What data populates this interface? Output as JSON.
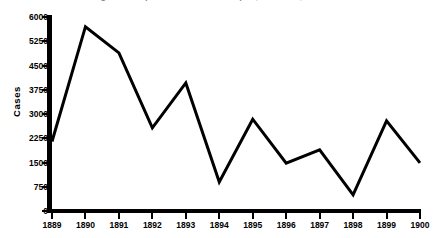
{
  "chart_data": {
    "type": "line",
    "title": "Figure 1. Reported cases of smallpox, Sheffield, 1889-1900",
    "xlabel": "",
    "ylabel": "Cases",
    "categories": [
      "1889",
      "1890",
      "1891",
      "1892",
      "1893",
      "1894",
      "1895",
      "1896",
      "1897",
      "1898",
      "1899",
      "1900"
    ],
    "values": [
      2150,
      5700,
      4890,
      2570,
      3960,
      900,
      2840,
      1480,
      1890,
      500,
      2790,
      1490
    ],
    "series": [
      {
        "name": "Cases",
        "values": [
          2150,
          5700,
          4890,
          2570,
          3960,
          900,
          2840,
          1480,
          1890,
          500,
          2790,
          1490
        ]
      }
    ],
    "ylim": [
      0,
      6000
    ],
    "yticks": [
      0,
      750,
      1500,
      2250,
      3000,
      3750,
      4500,
      5250,
      6000
    ],
    "ytick_labels": [
      "0",
      "750",
      "1500",
      "2250",
      "3000",
      "3750",
      "4500",
      "5250",
      "6000"
    ],
    "grid": false,
    "legend": false,
    "line_color": "#000000",
    "line_width": 3,
    "background_color": "#ffffff",
    "axis_color": "#000000"
  }
}
